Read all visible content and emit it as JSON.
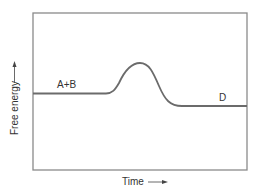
{
  "diagram": {
    "type": "reaction-energy-profile",
    "y_axis_label": "Free energy",
    "x_axis_label": "Time",
    "reactant_label": "A+B",
    "product_label": "D",
    "line_color": "#6b6b6b",
    "frame_color": "#8a8a8a",
    "text_color": "#333333"
  }
}
